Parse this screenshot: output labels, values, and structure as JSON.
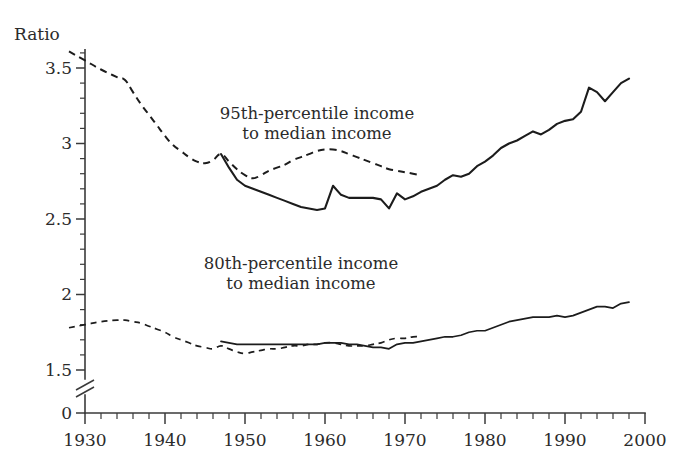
{
  "chart_data": {
    "type": "line",
    "title": "",
    "xlabel": "",
    "ylabel": "Ratio",
    "xlim": [
      1928,
      2000
    ],
    "ylim": [
      1.4,
      3.65
    ],
    "grid": false,
    "legend_position": "inline-annotations",
    "y_axis_break": true,
    "y_break_note": "axis broken between 1.5 and 0",
    "y_ticks": [
      "3.5",
      "3",
      "2.5",
      "2",
      "1.5",
      "0"
    ],
    "y_tick_values": [
      3.5,
      3,
      2.5,
      2,
      1.5,
      0
    ],
    "y_minor_tick_step": 0.1,
    "x_ticks": [
      "1930",
      "1940",
      "1950",
      "1960",
      "1970",
      "1980",
      "1990",
      "2000"
    ],
    "x_tick_values": [
      1930,
      1940,
      1950,
      1960,
      1970,
      1980,
      1990,
      2000
    ],
    "x_minor_tick_step": 2,
    "annotations": [
      {
        "name": "upper-series-label",
        "line1": "95th-percentile income",
        "line2": "to median income",
        "x": 1959,
        "y": 3.16
      },
      {
        "name": "lower-series-label",
        "line1": "80th-percentile income",
        "line2": "to median income",
        "x": 1957,
        "y": 2.17
      }
    ],
    "series": [
      {
        "name": "95th-percentile income to median income (historical, dashed)",
        "style": "dashed",
        "x": [
          1928,
          1930,
          1932,
          1934,
          1935,
          1936,
          1937,
          1938,
          1939,
          1940,
          1941,
          1942,
          1943,
          1944,
          1945,
          1946,
          1947,
          1948,
          1949,
          1950,
          1951,
          1952,
          1953,
          1954,
          1955,
          1956,
          1957,
          1958,
          1959,
          1960,
          1961,
          1962,
          1963,
          1964,
          1965,
          1966,
          1967,
          1968,
          1969,
          1970,
          1971,
          1972
        ],
        "values": [
          3.61,
          3.55,
          3.49,
          3.44,
          3.42,
          3.34,
          3.26,
          3.19,
          3.12,
          3.05,
          2.99,
          2.95,
          2.91,
          2.88,
          2.87,
          2.89,
          2.93,
          2.88,
          2.83,
          2.79,
          2.77,
          2.79,
          2.82,
          2.84,
          2.86,
          2.89,
          2.91,
          2.93,
          2.95,
          2.96,
          2.96,
          2.95,
          2.93,
          2.91,
          2.89,
          2.87,
          2.85,
          2.83,
          2.82,
          2.81,
          2.8,
          2.79
        ]
      },
      {
        "name": "95th-percentile income to median income (current, solid)",
        "style": "solid",
        "x": [
          1947,
          1948,
          1949,
          1950,
          1951,
          1952,
          1953,
          1954,
          1955,
          1956,
          1957,
          1958,
          1959,
          1960,
          1961,
          1962,
          1963,
          1964,
          1965,
          1966,
          1967,
          1968,
          1969,
          1970,
          1971,
          1972,
          1973,
          1974,
          1975,
          1976,
          1977,
          1978,
          1979,
          1980,
          1981,
          1982,
          1983,
          1984,
          1985,
          1986,
          1987,
          1988,
          1989,
          1990,
          1991,
          1992,
          1993,
          1994,
          1995,
          1996,
          1997,
          1998
        ],
        "values": [
          2.93,
          2.84,
          2.76,
          2.72,
          2.7,
          2.68,
          2.66,
          2.64,
          2.62,
          2.6,
          2.58,
          2.57,
          2.56,
          2.57,
          2.72,
          2.66,
          2.64,
          2.64,
          2.64,
          2.64,
          2.63,
          2.57,
          2.67,
          2.63,
          2.65,
          2.68,
          2.7,
          2.72,
          2.76,
          2.79,
          2.78,
          2.8,
          2.85,
          2.88,
          2.92,
          2.97,
          3.0,
          3.02,
          3.05,
          3.08,
          3.06,
          3.09,
          3.13,
          3.15,
          3.16,
          3.21,
          3.37,
          3.34,
          3.28,
          3.34,
          3.4,
          3.43
        ]
      },
      {
        "name": "80th-percentile income to median income (historical, dashed)",
        "style": "dashed-thin",
        "x": [
          1928,
          1930,
          1932,
          1934,
          1935,
          1936,
          1937,
          1938,
          1939,
          1940,
          1941,
          1942,
          1943,
          1944,
          1945,
          1946,
          1947,
          1948,
          1949,
          1950,
          1951,
          1952,
          1953,
          1954,
          1955,
          1956,
          1957,
          1958,
          1959,
          1960,
          1961,
          1962,
          1963,
          1964,
          1965,
          1966,
          1967,
          1968,
          1969,
          1970,
          1971,
          1972
        ],
        "values": [
          1.78,
          1.8,
          1.82,
          1.83,
          1.83,
          1.82,
          1.81,
          1.79,
          1.77,
          1.75,
          1.72,
          1.7,
          1.68,
          1.66,
          1.65,
          1.64,
          1.66,
          1.64,
          1.62,
          1.61,
          1.62,
          1.63,
          1.64,
          1.64,
          1.65,
          1.66,
          1.66,
          1.67,
          1.67,
          1.68,
          1.68,
          1.67,
          1.66,
          1.66,
          1.66,
          1.67,
          1.68,
          1.7,
          1.71,
          1.71,
          1.72,
          1.72
        ]
      },
      {
        "name": "80th-percentile income to median income (current, solid)",
        "style": "solid-thin",
        "x": [
          1947,
          1948,
          1949,
          1950,
          1951,
          1952,
          1953,
          1954,
          1955,
          1956,
          1957,
          1958,
          1959,
          1960,
          1961,
          1962,
          1963,
          1964,
          1965,
          1966,
          1967,
          1968,
          1969,
          1970,
          1971,
          1972,
          1973,
          1974,
          1975,
          1976,
          1977,
          1978,
          1979,
          1980,
          1981,
          1982,
          1983,
          1984,
          1985,
          1986,
          1987,
          1988,
          1989,
          1990,
          1991,
          1992,
          1993,
          1994,
          1995,
          1996,
          1997,
          1998
        ],
        "values": [
          1.69,
          1.68,
          1.67,
          1.67,
          1.67,
          1.67,
          1.67,
          1.67,
          1.67,
          1.67,
          1.67,
          1.67,
          1.67,
          1.68,
          1.68,
          1.68,
          1.67,
          1.67,
          1.66,
          1.65,
          1.65,
          1.64,
          1.67,
          1.68,
          1.68,
          1.69,
          1.7,
          1.71,
          1.72,
          1.72,
          1.73,
          1.75,
          1.76,
          1.76,
          1.78,
          1.8,
          1.82,
          1.83,
          1.84,
          1.85,
          1.85,
          1.85,
          1.86,
          1.85,
          1.86,
          1.88,
          1.9,
          1.92,
          1.92,
          1.91,
          1.94,
          1.95
        ]
      }
    ]
  }
}
